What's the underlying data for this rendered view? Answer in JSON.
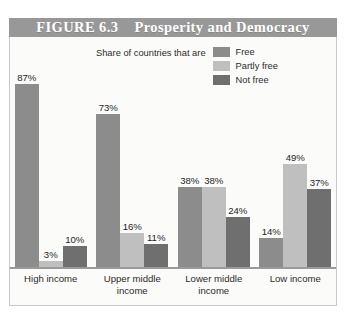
{
  "figure": {
    "banner_label": "FIGURE 6.3    Prosperity and Democracy",
    "banner_color": "#989898",
    "banner_text_color": "#ffffff"
  },
  "legend": {
    "caption": "Share of countries that are",
    "entries": [
      {
        "label": "Free",
        "color": "#8c8c8c",
        "swatch_name": "legend-swatch-free"
      },
      {
        "label": "Partly free",
        "color": "#bfbfbf",
        "swatch_name": "legend-swatch-partly-free"
      },
      {
        "label": "Not free",
        "color": "#6f6f6f",
        "swatch_name": "legend-swatch-not-free"
      }
    ]
  },
  "chart_data": {
    "type": "bar",
    "title": "FIGURE 6.3    Prosperity and Democracy",
    "xlabel": "",
    "ylabel": "",
    "ylim": [
      0,
      100
    ],
    "grid": false,
    "legend_position": "top-center",
    "legend_title": "Share of countries that are",
    "categories": [
      "High income",
      "Upper middle income",
      "Lower middle income",
      "Low income"
    ],
    "category_lines": [
      [
        "High income"
      ],
      [
        "Upper middle",
        "income"
      ],
      [
        "Lower middle",
        "income"
      ],
      [
        "Low income"
      ]
    ],
    "series": [
      {
        "name": "Free",
        "color": "#8c8c8c",
        "values": [
          87,
          73,
          38,
          14
        ],
        "labels": [
          "87%",
          "73%",
          "38%",
          "14%"
        ]
      },
      {
        "name": "Partly free",
        "color": "#bfbfbf",
        "values": [
          3,
          16,
          38,
          49
        ],
        "labels": [
          "3%",
          "16%",
          "38%",
          "49%"
        ]
      },
      {
        "name": "Not free",
        "color": "#6f6f6f",
        "values": [
          10,
          11,
          24,
          37
        ],
        "labels": [
          "10%",
          "11%",
          "24%",
          "37%"
        ]
      }
    ]
  }
}
